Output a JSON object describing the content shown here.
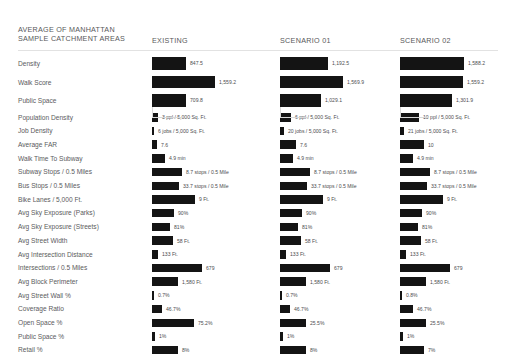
{
  "header": {
    "title": "AVERAGE OF MANHATTAN\nSAMPLE CATCHMENT AREAS",
    "columns": [
      {
        "label": "EXISTING",
        "x": 152
      },
      {
        "label": "SCENARIO 01",
        "x": 280
      },
      {
        "label": "SCENARIO 02",
        "x": 400
      }
    ]
  },
  "chart_data": {
    "type": "bar",
    "title": "AVERAGE OF MANHATTAN SAMPLE CATCHMENT AREAS",
    "xlabel": "",
    "ylabel": "",
    "orientation": "horizontal",
    "grid": false,
    "legend_position": "top",
    "series": [
      "EXISTING",
      "SCENARIO 01",
      "SCENARIO 02"
    ],
    "groups": [
      {
        "name": "summary-scores",
        "rows": [
          {
            "category": "Density",
            "values": [
              847.5,
              1192.5,
              1588.2
            ],
            "labels": [
              "847.5",
              "1,192.5",
              "1,588.2"
            ],
            "widths": [
              34,
              48,
              64
            ]
          },
          {
            "category": "Walk Score",
            "values": [
              1559.2,
              1569.9,
              1559.2
            ],
            "labels": [
              "1,559.2",
              "1,569.9",
              "1,559.2"
            ],
            "widths": [
              63,
              63,
              63
            ]
          },
          {
            "category": "Public Space",
            "values": [
              709.8,
              1029.1,
              1301.9
            ],
            "labels": [
              "709.8",
              "1,029.1",
              "1,301.9"
            ],
            "widths": [
              34,
              41,
              52
            ]
          }
        ]
      },
      {
        "name": "metrics",
        "rows": [
          {
            "category": "Population Density",
            "labels": [
              "3 ppl / 5,000 Sq. Ft.",
              "6 ppl / 5,000 Sq. Ft.",
              "10 ppl / 5,000 Sq. Ft."
            ],
            "values": [
              3,
              6,
              10
            ],
            "widths": [
              6,
              11,
              19
            ]
          },
          {
            "category": "Job Density",
            "labels": [
              "6 jobs / 5,000 Sq. Ft.",
              "20 jobs / 5,000 Sq. Ft.",
              "21 jobs / 5,000 Sq. Ft."
            ],
            "values": [
              6,
              20,
              21
            ],
            "widths": [
              2,
              4,
              4
            ]
          },
          {
            "category": "Average FAR",
            "labels": [
              "7.6",
              "7.6",
              "10"
            ],
            "values": [
              7.6,
              7.6,
              10
            ],
            "widths": [
              5,
              16,
              24
            ]
          },
          {
            "category": "Walk Time To Subway",
            "labels": [
              "4.9 min",
              "4.9 min",
              "4.9 min"
            ],
            "values": [
              4.9,
              4.9,
              4.9
            ],
            "widths": [
              13,
              13,
              13
            ]
          },
          {
            "category": "Subway Stops / 0.5 Miles",
            "labels": [
              "8.7 stops / 0.5 Mile",
              "8.7 stops / 0.5 Mile",
              "8.7 stops / 0.5 Mile"
            ],
            "values": [
              8.7,
              8.7,
              8.7
            ],
            "widths": [
              30,
              30,
              30
            ]
          },
          {
            "category": "Bus Stops / 0.5 Miles",
            "labels": [
              "33.7 stops / 0.5 Mile",
              "33.7 stops / 0.5 Mile",
              "33.7 stops / 0.5 Mile"
            ],
            "values": [
              33.7,
              33.7,
              33.7
            ],
            "widths": [
              27,
              27,
              27
            ]
          },
          {
            "category": "Bike Lanes / 5,000 Ft.",
            "labels": [
              "9 Ft.",
              "9 Ft.",
              "9 Ft."
            ],
            "values": [
              9,
              9,
              9
            ],
            "widths": [
              43,
              43,
              43
            ]
          },
          {
            "category": "Avg Sky Exposure (Parks)",
            "labels": [
              "90%",
              "90%",
              "90%"
            ],
            "values": [
              90,
              90,
              90
            ],
            "widths": [
              22,
              22,
              22
            ]
          },
          {
            "category": "Avg Sky Exposure (Streets)",
            "labels": [
              "81%",
              "81%",
              "81%"
            ],
            "values": [
              81,
              81,
              81
            ],
            "widths": [
              18,
              18,
              18
            ]
          },
          {
            "category": "Avg Street Width",
            "labels": [
              "58 Ft.",
              "58 Ft.",
              "58 Ft."
            ],
            "values": [
              58,
              58,
              58
            ],
            "widths": [
              21,
              21,
              21
            ]
          },
          {
            "category": "Avg Intersection Distance",
            "labels": [
              "133 Ft.",
              "133 Ft.",
              "133 Ft."
            ],
            "values": [
              133,
              133,
              133
            ],
            "widths": [
              6,
              6,
              6
            ]
          },
          {
            "category": "Intersections / 0.5 Miles",
            "labels": [
              "679",
              "679",
              "679"
            ],
            "values": [
              679,
              679,
              679
            ],
            "widths": [
              50,
              50,
              50
            ]
          },
          {
            "category": "Avg Block Perimeter",
            "labels": [
              "1,580 Ft.",
              "1,580 Ft.",
              "1,580 Ft."
            ],
            "values": [
              1580,
              1580,
              1580
            ],
            "widths": [
              26,
              26,
              26
            ]
          },
          {
            "category": "Avg Street Wall %",
            "labels": [
              "0.7%",
              "0.7%",
              "0.8%"
            ],
            "values": [
              0.7,
              0.7,
              0.8
            ],
            "widths": [
              2,
              2,
              2
            ]
          },
          {
            "category": "Coverage Ratio",
            "labels": [
              "46.7%",
              "46.7%",
              "46.7%"
            ],
            "values": [
              46.7,
              46.7,
              46.7
            ],
            "widths": [
              10,
              10,
              13
            ]
          },
          {
            "category": "Open Space %",
            "labels": [
              "75.2%",
              "25.5%",
              "25.5%"
            ],
            "values": [
              75.2,
              25.5,
              25.5
            ],
            "widths": [
              42,
              26,
              26
            ]
          },
          {
            "category": "Public Space %",
            "labels": [
              "1%",
              "1%",
              "1%"
            ],
            "values": [
              1,
              1,
              1
            ],
            "widths": [
              3,
              3,
              3
            ]
          },
          {
            "category": "Retail %",
            "labels": [
              "8%",
              "8%",
              "7%"
            ],
            "values": [
              8,
              8,
              7
            ],
            "widths": [
              26,
              26,
              24
            ]
          }
        ]
      }
    ]
  },
  "colors": {
    "bar": "#141414",
    "text": "#5b5b5d",
    "rule": "#e2e2e2",
    "background": "#ffffff"
  }
}
